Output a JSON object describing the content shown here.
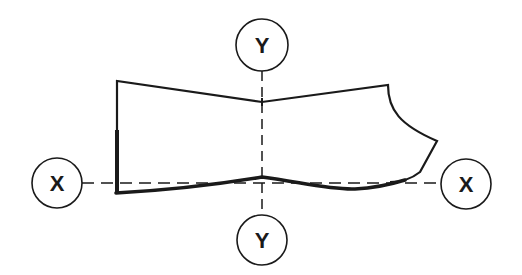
{
  "diagram": {
    "axes": {
      "x": {
        "left_label": "X",
        "right_label": "X",
        "style": "dashed"
      },
      "y": {
        "top_label": "Y",
        "bottom_label": "Y",
        "style": "dashed"
      }
    },
    "colors": {
      "stroke": "#1a1a1a",
      "background": "#ffffff"
    }
  }
}
